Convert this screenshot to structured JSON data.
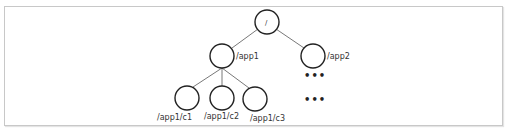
{
  "diagram": {
    "type": "tree",
    "nodes": [
      {
        "id": "root",
        "label": "/",
        "cx": 267,
        "cy": 22
      },
      {
        "id": "app1",
        "label": "/app1",
        "cx": 222,
        "cy": 56
      },
      {
        "id": "app2",
        "label": "/app2",
        "cx": 313,
        "cy": 56
      },
      {
        "id": "c1",
        "label": "/app1/c1",
        "cx": 187,
        "cy": 98
      },
      {
        "id": "c2",
        "label": "/app1/c2",
        "cx": 222,
        "cy": 98
      },
      {
        "id": "c3",
        "label": "/app1/c3",
        "cx": 255,
        "cy": 99
      }
    ],
    "edges": [
      [
        "root",
        "app1"
      ],
      [
        "root",
        "app2"
      ],
      [
        "app1",
        "c1"
      ],
      [
        "app1",
        "c2"
      ],
      [
        "app1",
        "c3"
      ]
    ],
    "ellipses": [
      {
        "text": "•••",
        "x": 304,
        "y": 79
      },
      {
        "text": "•••",
        "x": 304,
        "y": 103
      }
    ],
    "colors": {
      "stroke": "#222222",
      "edge": "#555555",
      "border": "#c8c8c8"
    }
  }
}
